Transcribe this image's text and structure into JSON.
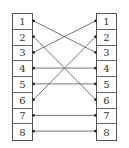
{
  "diagram": {
    "type": "pin-mapping",
    "left_pins": [
      "1",
      "2",
      "3",
      "4",
      "5",
      "6",
      "7",
      "8"
    ],
    "right_pins": [
      "1",
      "2",
      "3",
      "4",
      "5",
      "6",
      "7",
      "8"
    ],
    "connections": [
      {
        "from": "1",
        "to": "3"
      },
      {
        "from": "2",
        "to": "6"
      },
      {
        "from": "3",
        "to": "1"
      },
      {
        "from": "4",
        "to": "4"
      },
      {
        "from": "5",
        "to": "5"
      },
      {
        "from": "6",
        "to": "2"
      },
      {
        "from": "7",
        "to": "7"
      },
      {
        "from": "8",
        "to": "8"
      }
    ],
    "colors": {
      "line": "#555555",
      "border": "#555555",
      "text": "#333333"
    }
  }
}
